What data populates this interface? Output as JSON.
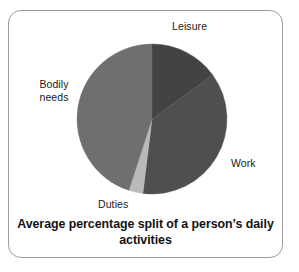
{
  "figure": {
    "caption": "Average percentage split of a person’s daily activities",
    "frame_border_color": "#9c9c9c",
    "background_color": "#ffffff"
  },
  "labels": {
    "leisure": "Leisure",
    "work": "Work",
    "bodily_needs": "Bodily\nneeds",
    "duties": "Duties"
  },
  "chart_data": {
    "type": "pie",
    "title": "Average percentage split of a person’s daily activities",
    "xlabel": "",
    "ylabel": "",
    "legend_position": "none",
    "labels_position": "outside-callout",
    "grid": false,
    "start_angle_deg": 0,
    "direction": "clockwise",
    "categories": [
      "Leisure",
      "Work",
      "Duties",
      "Bodily needs"
    ],
    "values": [
      15,
      37,
      3,
      45
    ],
    "unit": "percent",
    "slices": [
      {
        "name": "Leisure",
        "value": 15,
        "color": "#434343",
        "start_angle_deg": 0,
        "end_angle_deg": 54
      },
      {
        "name": "Work",
        "value": 37,
        "color": "#4f4f4f",
        "start_angle_deg": 54,
        "end_angle_deg": 187
      },
      {
        "name": "Duties",
        "value": 3,
        "color": "#b9b9b9",
        "start_angle_deg": 187,
        "end_angle_deg": 198
      },
      {
        "name": "Bodily needs",
        "value": 45,
        "color": "#6f6f6f",
        "start_angle_deg": 198,
        "end_angle_deg": 360
      }
    ],
    "geometry": {
      "center_x": 152,
      "center_y": 119,
      "radius": 75
    }
  }
}
